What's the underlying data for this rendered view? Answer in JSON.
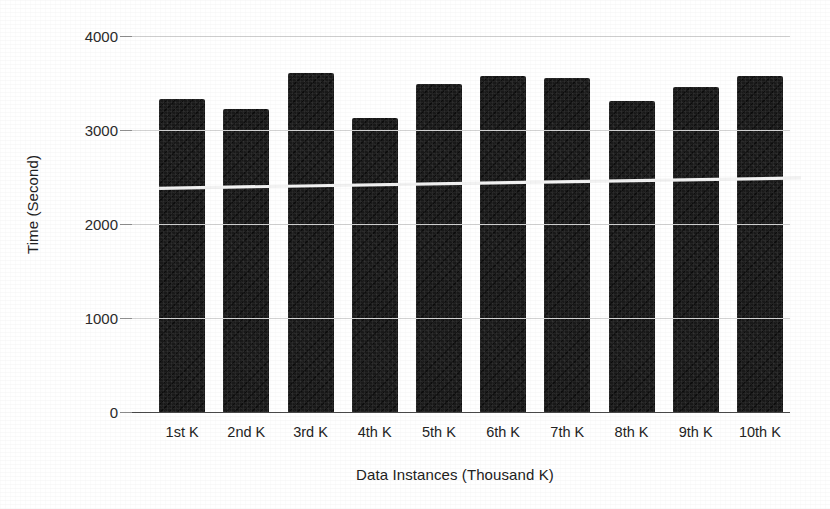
{
  "chart_data": {
    "type": "bar",
    "title": "",
    "subtitle": "",
    "xlabel": "Data Instances (Thousand K)",
    "ylabel": "Time (Second)",
    "categories": [
      "1st K",
      "2nd K",
      "3rd K",
      "4th K",
      "5th K",
      "6th K",
      "7th K",
      "8th K",
      "9th K",
      "10th K"
    ],
    "values": [
      3330,
      3225,
      3610,
      3130,
      3485,
      3570,
      3550,
      3310,
      3460,
      3570
    ],
    "series": [
      {
        "name": "Time (Second)",
        "values": [
          3330,
          3225,
          3610,
          3130,
          3485,
          3570,
          3550,
          3310,
          3460,
          3570
        ]
      }
    ],
    "trendline": {
      "name": "trend",
      "start_value": 2380,
      "end_value": 2490,
      "color": "#f2f2f2"
    },
    "ylim": [
      0,
      4000
    ],
    "yticks": [
      0,
      1000,
      2000,
      3000,
      4000
    ],
    "ytick_labels": [
      "0",
      "1000",
      "2000",
      "3000",
      "4000"
    ],
    "grid": true,
    "legend": "none",
    "bar_color": "#191919",
    "grid_color": "#d2d2d2",
    "axis_color": "#4a4a4a"
  }
}
